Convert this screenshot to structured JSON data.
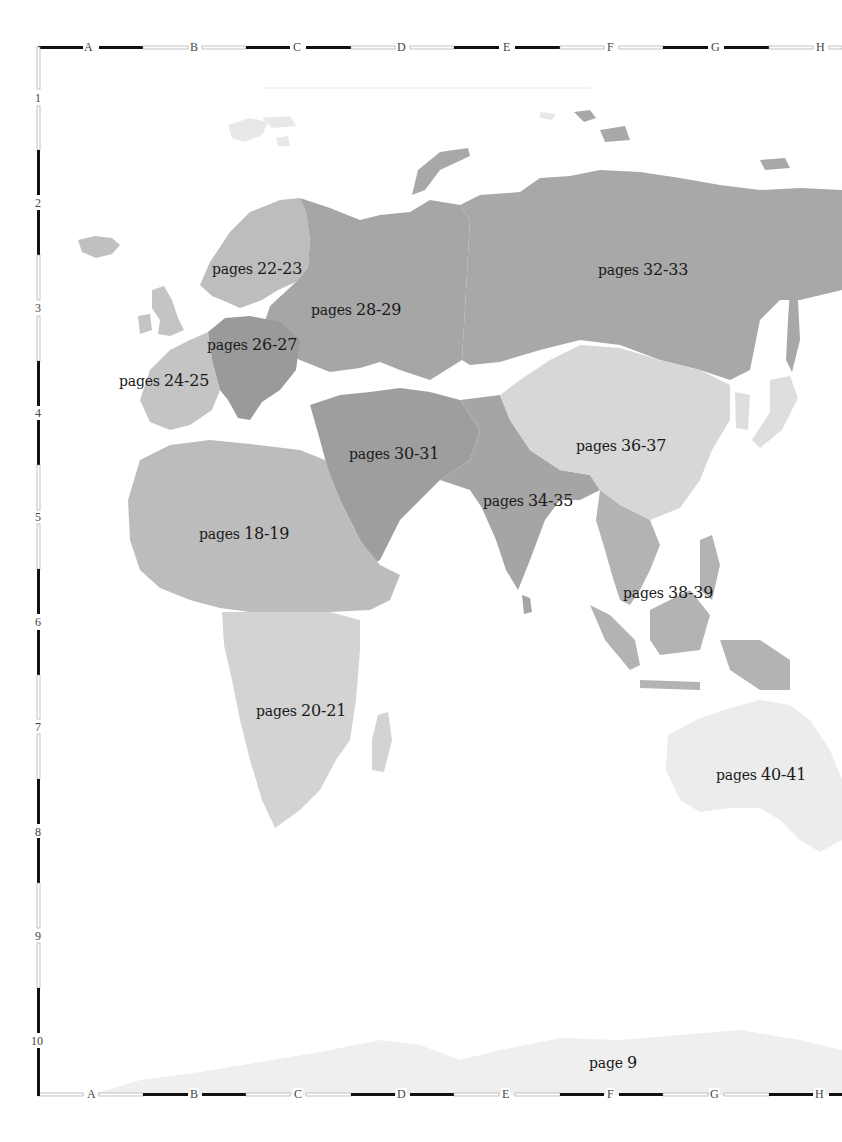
{
  "map": {
    "type": "atlas-locator-map",
    "colors": {
      "background": "#ffffff",
      "ocean": "#ffffff",
      "russia": "#a8a8a8",
      "russia_west": "#a4a4a4",
      "central_europe": "#9a9a9a",
      "scandinavia": "#bdbdbd",
      "western_europe": "#c4c4c4",
      "middle_east": "#9e9e9e",
      "south_asia": "#a5a5a5",
      "china": "#d7d7d7",
      "southeast_asia": "#b3b3b3",
      "north_africa": "#bcbcbc",
      "southern_africa": "#d3d3d3",
      "australia": "#ececec",
      "antarctica": "#efefef",
      "arctic_islands": "#e6e6e6",
      "border_dark": "#111111",
      "border_light": "#ffffff"
    },
    "grid": {
      "columns": [
        "A",
        "B",
        "C",
        "D",
        "E",
        "F",
        "G",
        "H"
      ],
      "rows": [
        "1",
        "2",
        "3",
        "4",
        "5",
        "6",
        "7",
        "8",
        "9",
        "10"
      ]
    },
    "regions": [
      {
        "id": "scandinavia",
        "prefix": "pages",
        "pages": "22-23"
      },
      {
        "id": "russia-west",
        "prefix": "pages",
        "pages": "28-29"
      },
      {
        "id": "russia-east",
        "prefix": "pages",
        "pages": "32-33"
      },
      {
        "id": "central-europe",
        "prefix": "pages",
        "pages": "26-27"
      },
      {
        "id": "western-europe",
        "prefix": "pages",
        "pages": "24-25"
      },
      {
        "id": "middle-east",
        "prefix": "pages",
        "pages": "30-31"
      },
      {
        "id": "china",
        "prefix": "pages",
        "pages": "36-37"
      },
      {
        "id": "south-asia",
        "prefix": "pages",
        "pages": "34-35"
      },
      {
        "id": "north-africa",
        "prefix": "pages",
        "pages": "18-19"
      },
      {
        "id": "southeast-asia",
        "prefix": "pages",
        "pages": "38-39"
      },
      {
        "id": "southern-africa",
        "prefix": "pages",
        "pages": "20-21"
      },
      {
        "id": "australia",
        "prefix": "pages",
        "pages": "40-41"
      },
      {
        "id": "antarctica",
        "prefix": "page",
        "pages": "9"
      }
    ]
  }
}
